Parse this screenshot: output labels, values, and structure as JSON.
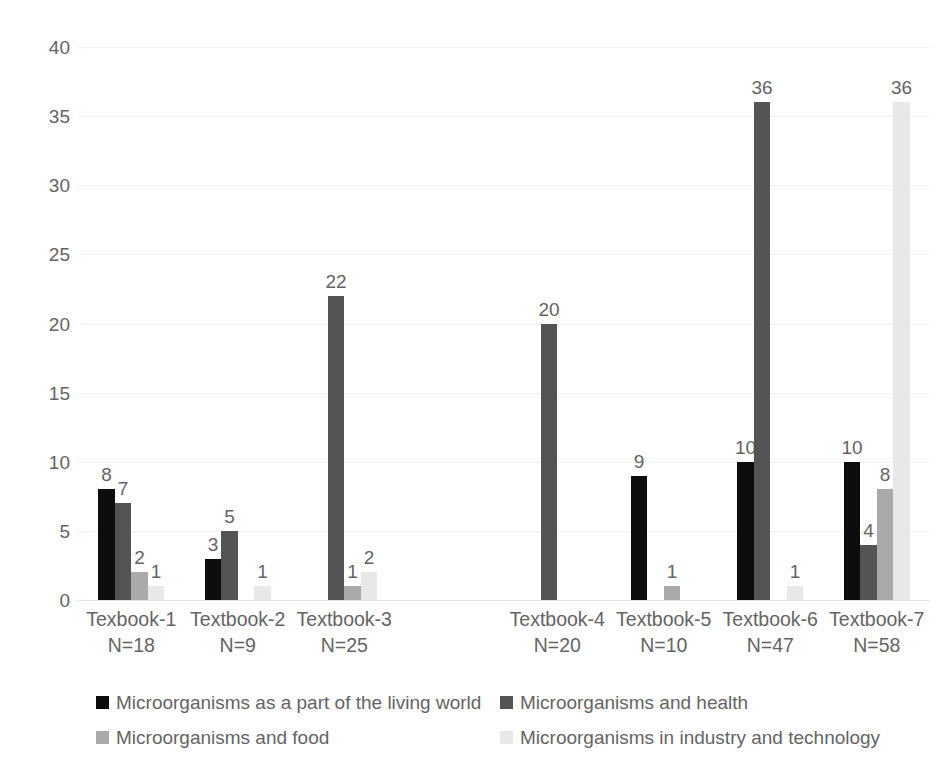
{
  "chart_data": {
    "type": "bar",
    "title": "",
    "subtitle": "",
    "xlabel": "",
    "ylabel": "",
    "ylim": [
      0,
      40
    ],
    "yticks": [
      0,
      5,
      10,
      15,
      20,
      25,
      30,
      35,
      40
    ],
    "ytick_labels": [
      "0",
      "5",
      "10",
      "15",
      "20",
      "25",
      "30",
      "35",
      "40"
    ],
    "grid": true,
    "legend_position": "bottom",
    "grouping": "clustered",
    "categories": [
      "Texbook-1",
      "Textbook-2",
      "Textbook-3",
      "",
      "Textbook-4",
      "Textbook-5",
      "Textbook-6",
      "Textbook-7"
    ],
    "category_sublabels": [
      "N=18",
      "N=9",
      "N=25",
      "",
      "N=20",
      "N=10",
      "N=47",
      "N=58"
    ],
    "series": [
      {
        "name": "Microorganisms as a part of the living world",
        "color": "#0d0d0d",
        "values": [
          8,
          3,
          0,
          0,
          0,
          9,
          10,
          10
        ]
      },
      {
        "name": "Microorganisms and health",
        "color": "#545454",
        "values": [
          7,
          5,
          22,
          0,
          20,
          0,
          36,
          4
        ]
      },
      {
        "name": "Microorganisms and food",
        "color": "#aaaaaa",
        "values": [
          2,
          0,
          1,
          0,
          0,
          1,
          0,
          8
        ]
      },
      {
        "name": "Microorganisms in industry and technology",
        "color": "#e8e8e8",
        "values": [
          1,
          1,
          2,
          0,
          0,
          0,
          1,
          36
        ]
      }
    ],
    "data_labels": {
      "show": true,
      "hide_zero": true
    },
    "colors": {
      "text": "#646464",
      "gridline": "#f2f2f2",
      "background": "#ffffff"
    }
  },
  "legend": {
    "items": [
      {
        "label": "Microorganisms as a part of the living world",
        "color": "#0d0d0d"
      },
      {
        "label": "Microorganisms and health",
        "color": "#545454"
      },
      {
        "label": "Microorganisms and food",
        "color": "#aaaaaa"
      },
      {
        "label": "Microorganisms in industry and technology",
        "color": "#e8e8e8"
      }
    ]
  }
}
